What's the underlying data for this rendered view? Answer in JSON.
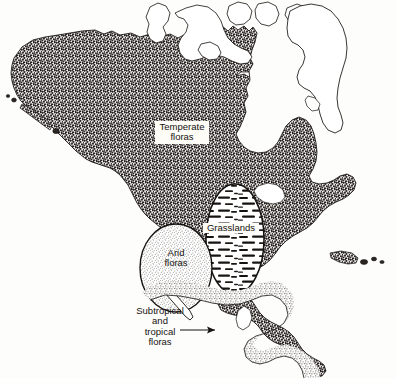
{
  "figure": {
    "name": "north-america-floristic-regions",
    "background_color": "#fdfdfc",
    "ink_color": "#15120f"
  },
  "labels": {
    "temperate": {
      "text": "Temperate\nfloras",
      "boxed": "true",
      "region": "temperate-floras"
    },
    "grasslands": {
      "text": "Grasslands",
      "boxed": "true",
      "region": "grasslands"
    },
    "arid": {
      "text": "Arid\nfloras",
      "boxed": "false",
      "region": "arid-floras"
    },
    "subtropical": {
      "text": "Subtropical\nand\ntropical\nfloras",
      "boxed": "false",
      "region": "subtropical-tropical-floras"
    }
  },
  "regions": [
    {
      "id": "temperate-floras",
      "label": "Temperate floras",
      "fill_pattern": "dense-stipple",
      "fill_color": "#2b2622"
    },
    {
      "id": "grasslands",
      "label": "Grasslands",
      "fill_pattern": "horizontal-dashes",
      "fill_color": "#1a1714"
    },
    {
      "id": "arid-floras",
      "label": "Arid floras",
      "fill_pattern": "fine-stipple",
      "fill_color": "#6e6760"
    },
    {
      "id": "subtropical-tropical-floras",
      "label": "Subtropical and tropical floras",
      "fill_pattern": "medium-stipple",
      "fill_color": "#8a837b"
    },
    {
      "id": "arctic-islands-greenland",
      "label": "Arctic islands and Greenland",
      "fill_pattern": "outline-only",
      "fill_color": "#ffffff"
    }
  ],
  "annotations": {
    "leader_arrow": {
      "name": "subtropical-leader-arrow",
      "direction": "right"
    }
  }
}
